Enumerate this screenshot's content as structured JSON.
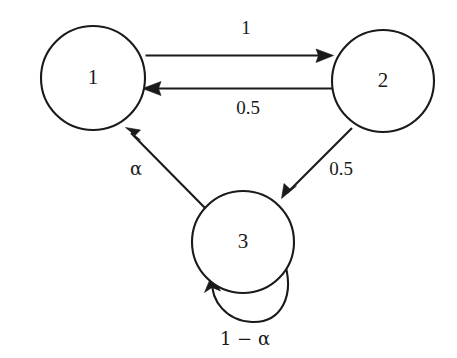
{
  "diagram": {
    "type": "state-transition-diagram",
    "background_color": "#ffffff",
    "stroke_color": "#1a1a1a",
    "nodes": [
      {
        "id": "1",
        "label": "1",
        "cx": 93,
        "cy": 78,
        "r": 52
      },
      {
        "id": "2",
        "label": "2",
        "cx": 383,
        "cy": 81,
        "r": 51
      },
      {
        "id": "3",
        "label": "3",
        "cx": 243,
        "cy": 242,
        "r": 51
      }
    ],
    "edges": [
      {
        "id": "edge-1-to-2",
        "from": "1",
        "to": "2",
        "label": "1",
        "label_x": 246,
        "label_y": 30,
        "kind": "straight-horizontal-top"
      },
      {
        "id": "edge-2-to-1",
        "from": "2",
        "to": "1",
        "label": "0.5",
        "label_x": 248,
        "label_y": 110,
        "kind": "straight-horizontal-bottom"
      },
      {
        "id": "edge-2-to-3",
        "from": "2",
        "to": "3",
        "label": "0.5",
        "label_x": 341,
        "label_y": 171,
        "kind": "diagonal-down-left"
      },
      {
        "id": "edge-3-to-1",
        "from": "3",
        "to": "1",
        "label": "α",
        "label_x": 136,
        "label_y": 170,
        "kind": "diagonal-up-left"
      },
      {
        "id": "edge-3-to-3",
        "from": "3",
        "to": "3",
        "label": "1 − α",
        "label_x": 245,
        "label_y": 340,
        "kind": "self-loop"
      }
    ]
  }
}
